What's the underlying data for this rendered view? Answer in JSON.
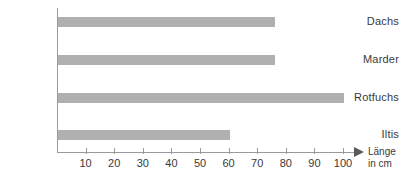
{
  "chart_data": {
    "type": "bar",
    "orientation": "horizontal",
    "title": "",
    "xlabel": "Länge in cm",
    "ylabel": "",
    "categories": [
      "Dachs",
      "Marder",
      "Rotfuchs",
      "Iltis"
    ],
    "values": [
      76,
      76,
      100,
      60
    ],
    "xlim": [
      0,
      105
    ],
    "ticks": [
      10,
      20,
      30,
      40,
      50,
      60,
      70,
      80,
      90,
      100
    ],
    "grid": false,
    "legend": null,
    "bar_color": "#b0b0b0",
    "axis_color": "#9a9a9a",
    "text_color": "#3a3a3a",
    "axis_title_lines": [
      "Länge",
      "in cm"
    ]
  }
}
